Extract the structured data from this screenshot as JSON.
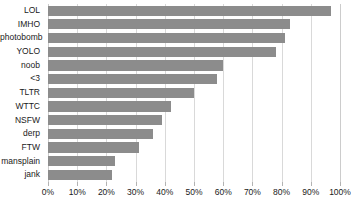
{
  "chart_data": {
    "type": "bar",
    "orientation": "horizontal",
    "title": "",
    "subtitle": "",
    "xlabel": "",
    "ylabel": "",
    "categories": [
      "LOL",
      "IMHO",
      "photobomb",
      "YOLO",
      "noob",
      "<3",
      "TLTR",
      "WTTC",
      "NSFW",
      "derp",
      "FTW",
      "mansplain",
      "jank"
    ],
    "values": [
      97,
      83,
      81,
      78,
      60,
      58,
      50,
      42,
      39,
      36,
      31,
      23,
      22
    ],
    "value_suffix": "%",
    "xlim": [
      0,
      100
    ],
    "xticks": [
      0,
      10,
      20,
      30,
      40,
      50,
      60,
      70,
      80,
      90,
      100
    ],
    "xticklabels": [
      "0%",
      "10%",
      "20%",
      "30%",
      "40%",
      "50%",
      "60%",
      "70%",
      "80%",
      "90%",
      "100%"
    ],
    "grid": true,
    "grid_axis": "x",
    "legend": false,
    "legend_position": "none",
    "bar_color": "#8c8c8c",
    "gridline_color": "#d9d9d9",
    "background_color": "#ffffff",
    "text_color": "#1a1a1a"
  }
}
